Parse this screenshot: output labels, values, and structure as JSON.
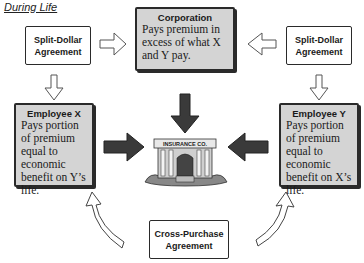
{
  "title": "During Life",
  "nodes": {
    "split_dollar_left": {
      "label_line1": "Split-Dollar",
      "label_line2": "Agreement"
    },
    "split_dollar_right": {
      "label_line1": "Split-Dollar",
      "label_line2": "Agreement"
    },
    "corporation": {
      "header": "Corporation",
      "text": "Pays premium in excess of what X and Y pay."
    },
    "employee_x": {
      "header": "Employee X",
      "text": "Pays portion of premium equal to economic benefit on Y’s life."
    },
    "employee_y": {
      "header": "Employee Y",
      "text": "Pays portion of premium equal to economic benefit on X’s life."
    },
    "insurance_co": {
      "sign": "INSURANCE CO."
    },
    "cross_purchase": {
      "label_line1": "Cross-Purchase",
      "label_line2": "Agreement"
    }
  },
  "colors": {
    "box_gray": "#d4d4d4",
    "stroke": "#2a2a2a",
    "dark_arrow": "#3a3a3a"
  }
}
